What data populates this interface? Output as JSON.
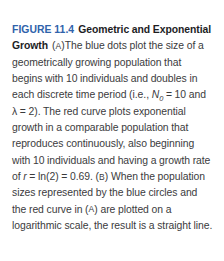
{
  "figure": {
    "number_label": "FIGURE 11.4",
    "title": "Geometric and Exponential Growth",
    "panel_a_marker": "A",
    "panel_b_marker": "B",
    "caption_part_a_1": "The blue dots plot the size of a geometrically growing population that begins with 10 individuals and doubles in each discrete time period (i.e., ",
    "formula_N": "N",
    "formula_N_sub": "0",
    "formula_N_value": " = 10 and ",
    "formula_lambda": "λ = 2).",
    "caption_part_a_2": " The red curve plots exponential growth in a comparable population that reproduces continuously, also beginning with 10 individuals and having a growth rate of ",
    "formula_r": "r",
    "formula_r_value": " = ln(2) = 0.69.",
    "caption_part_b": "When the population sizes represented by the blue circles and the red curve in (",
    "caption_part_b_2": ") are plotted on a logarithmic scale, the result is a straight line.",
    "colors": {
      "figure_number": "#2f63ab",
      "title": "#1d1d1f",
      "body_text": "#3b3b3d",
      "background": "#ffffff"
    }
  }
}
